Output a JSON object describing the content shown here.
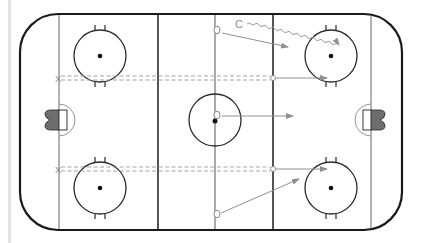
{
  "diagram": {
    "type": "hockey-rink-drill",
    "colors": {
      "board": "#1a1a1a",
      "line": "#2a2a2a",
      "thin_line": "#555555",
      "pass": "#909090",
      "skate": "#909090",
      "goal_fill": "#6e6e6e",
      "background": "#ffffff"
    },
    "labels": {
      "coach": "C",
      "x_top": "X",
      "x_bottom": "X"
    },
    "players": [
      {
        "id": "o1",
        "symbol": "O",
        "x": 217,
        "y": 30
      },
      {
        "id": "o2",
        "symbol": "O",
        "x": 217,
        "y": 115
      },
      {
        "id": "o3",
        "symbol": "O",
        "x": 217,
        "y": 214
      }
    ],
    "arrows": [
      {
        "kind": "pass",
        "from": [
          222,
          33
        ],
        "to": [
          288,
          47
        ]
      },
      {
        "kind": "skate-wavy",
        "from": [
          247,
          25
        ],
        "to": [
          340,
          45
        ]
      },
      {
        "kind": "pass",
        "from": [
          222,
          116
        ],
        "to": [
          292,
          116
        ]
      },
      {
        "kind": "pass",
        "from": [
          272,
          78
        ],
        "to": [
          327,
          78
        ]
      },
      {
        "kind": "pass",
        "from": [
          272,
          169
        ],
        "to": [
          327,
          169
        ]
      },
      {
        "kind": "pass",
        "from": [
          221,
          213
        ],
        "to": [
          298,
          180
        ]
      }
    ]
  }
}
